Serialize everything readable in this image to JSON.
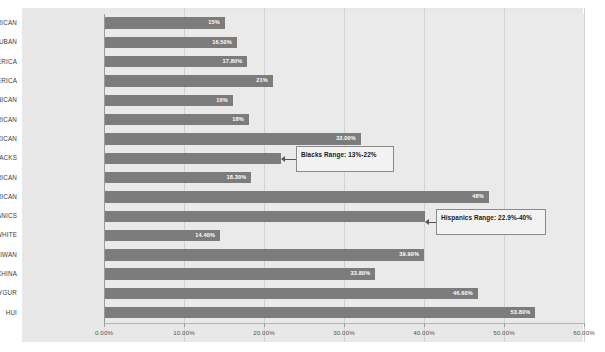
{
  "chart_data": {
    "type": "bar",
    "orientation": "horizontal",
    "title": "",
    "subtitle": "",
    "xlabel": "",
    "ylabel": "",
    "xlim": [
      0,
      60
    ],
    "grid": true,
    "legend": "none",
    "xtick_labels": [
      "0.00%",
      "10.00%",
      "20.00%",
      "30.00%",
      "40.00%",
      "50.00%",
      "60.00%"
    ],
    "xtick_values": [
      0,
      10,
      20,
      30,
      40,
      50,
      60
    ],
    "categories": [
      "PUERTO RICAN",
      "CUBAN",
      "SOUTH AMERICA",
      "CENTRAL AMERICA",
      "DOMINICAN",
      "PUERTO RICAN",
      "MEXICAN",
      "BLACKS",
      "ASIAN AMERICAN",
      "MEXICAN AMERICAN",
      "HISPANICS",
      "AMERICAN WHITE",
      "TAIWAN",
      "N.W CHINA",
      "UYGUR",
      "HUI"
    ],
    "values": [
      15,
      16.5,
      17.8,
      21,
      16,
      18,
      32,
      22,
      18.3,
      48,
      40,
      14.4,
      39.9,
      33.8,
      46.6,
      53.8
    ],
    "data_labels": [
      "15%",
      "16.50%",
      "17.80%",
      "21%",
      "16%",
      "18%",
      "32.00%",
      "",
      "18.30%",
      "48%",
      "",
      "14.40%",
      "39.90%",
      "33.80%",
      "46.60%",
      "53.80%"
    ],
    "annotations": [
      {
        "name": "blacks-range-callout",
        "text": "Blacks Range: 13%-22%",
        "target_category": "BLACKS"
      },
      {
        "name": "hispanics-range-callout",
        "text": "Hispanics Range: 22.9%-40%",
        "target_category": "HISPANICS"
      }
    ],
    "colors": {
      "bar": "#7c7c7c",
      "plot_background": "#eaeaea",
      "frame_background": "#e8e8e8",
      "gridline": "#d2d2d2",
      "data_label_text": "#ffffff",
      "category_label_text": "#3a3a3a",
      "callout_border": "#8a8a8a",
      "callout_background": "#f2f2f2"
    }
  }
}
